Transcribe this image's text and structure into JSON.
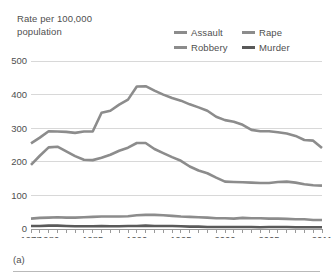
{
  "figure": {
    "caption": "(a)",
    "axis_title": "Rate per 100,000\npopulation"
  },
  "legend": {
    "position": "top-right",
    "items": [
      {
        "label": "Assault",
        "color": "#8c8c8c"
      },
      {
        "label": "Rape",
        "color": "#8c8c8c"
      },
      {
        "label": "Robbery",
        "color": "#8c8c8c"
      },
      {
        "label": "Murder",
        "color": "#595959"
      }
    ]
  },
  "chart_data": {
    "type": "line",
    "title": "",
    "subtitle": "",
    "xlabel": "",
    "ylabel": "Rate per 100,000 population",
    "xlim": [
      1978,
      2011
    ],
    "ylim": [
      0,
      500
    ],
    "grid": true,
    "legend_position": "top-right",
    "yticks": [
      0,
      100,
      200,
      300,
      400,
      500
    ],
    "ytick_labels": [
      "0",
      "100",
      "200",
      "300",
      "400",
      "500"
    ],
    "xticks": [
      1978,
      1980,
      1985,
      1990,
      1995,
      2000,
      2005,
      2011
    ],
    "xtick_labels": [
      "1978",
      "1980",
      "1985",
      "1990",
      "1995",
      "2000",
      "2005",
      "2011"
    ],
    "x": [
      1978,
      1979,
      1980,
      1981,
      1982,
      1983,
      1984,
      1985,
      1986,
      1987,
      1988,
      1989,
      1990,
      1991,
      1992,
      1993,
      1994,
      1995,
      1996,
      1997,
      1998,
      1999,
      2000,
      2001,
      2002,
      2003,
      2004,
      2005,
      2006,
      2007,
      2008,
      2009,
      2010,
      2011
    ],
    "series": [
      {
        "name": "Assault",
        "color": "#8c8c8c",
        "values": [
          255,
          272,
          291,
          290,
          289,
          286,
          290,
          290,
          346,
          352,
          370,
          385,
          424,
          425,
          412,
          400,
          390,
          382,
          371,
          362,
          352,
          334,
          324,
          319,
          310,
          295,
          291,
          291,
          288,
          284,
          277,
          265,
          263,
          241
        ]
      },
      {
        "name": "Robbery",
        "color": "#8c8c8c",
        "values": [
          191,
          218,
          243,
          245,
          231,
          217,
          206,
          205,
          212,
          221,
          233,
          242,
          256,
          256,
          238,
          226,
          214,
          203,
          186,
          174,
          166,
          153,
          141,
          140,
          139,
          138,
          137,
          137,
          140,
          141,
          138,
          133,
          130,
          129
        ]
      },
      {
        "name": "Rape",
        "color": "#8c8c8c",
        "values": [
          31,
          33,
          34,
          35,
          34,
          34,
          35,
          36,
          37,
          37,
          37,
          38,
          41,
          42,
          42,
          41,
          39,
          37,
          36,
          35,
          34,
          32,
          32,
          31,
          33,
          32,
          32,
          31,
          31,
          30,
          29,
          29,
          27,
          27
        ]
      },
      {
        "name": "Murder",
        "color": "#595959",
        "values": [
          9,
          9,
          10,
          10,
          9,
          8,
          8,
          8,
          9,
          8,
          8,
          9,
          9,
          10,
          9,
          9,
          9,
          8,
          7,
          7,
          6,
          6,
          6,
          6,
          6,
          6,
          5,
          6,
          6,
          6,
          5,
          5,
          5,
          5
        ]
      }
    ]
  }
}
